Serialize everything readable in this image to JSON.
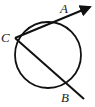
{
  "diagram": {
    "type": "geometry",
    "circle": {
      "cx": 48,
      "cy": 55,
      "r": 33
    },
    "points": [
      {
        "label": "C",
        "x": 15,
        "y": 38
      },
      {
        "label": "A",
        "x": 64,
        "y": 18
      },
      {
        "label": "B",
        "x": 67,
        "y": 82
      }
    ],
    "rays": [
      {
        "from": "C",
        "through": "A",
        "end": [
          90,
          7
        ]
      },
      {
        "from": "C",
        "through": "B",
        "end": [
          84,
          99
        ]
      }
    ],
    "labels": {
      "A": "A",
      "B": "B",
      "C": "C"
    },
    "colors": {
      "stroke": "#111111",
      "background": "#ffffff"
    }
  }
}
